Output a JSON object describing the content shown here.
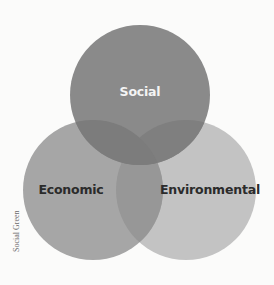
{
  "diagram": {
    "type": "venn",
    "circles": [
      {
        "id": "social",
        "label": "Social",
        "cx": 140,
        "cy": 95,
        "r": 70,
        "color": "#8a8a8a",
        "label_color": "#f4f4f4"
      },
      {
        "id": "economic",
        "label": "Economic",
        "cx": 93,
        "cy": 190,
        "r": 70,
        "color": "#a6a6a6",
        "label_color": "#2b2b2b"
      },
      {
        "id": "environmental",
        "label": "Environmental",
        "cx": 186,
        "cy": 190,
        "r": 70,
        "color": "#c3c3c3",
        "label_color": "#2b2b2b"
      }
    ]
  },
  "labels": {
    "social": "Social",
    "economic": "Economic",
    "environmental": "Environmental"
  },
  "credit": "Social Green",
  "colors": {
    "background": "#fbfbfa",
    "social": "#8a8a8a",
    "economic": "#a6a6a6",
    "environmental": "#c3c3c3"
  }
}
